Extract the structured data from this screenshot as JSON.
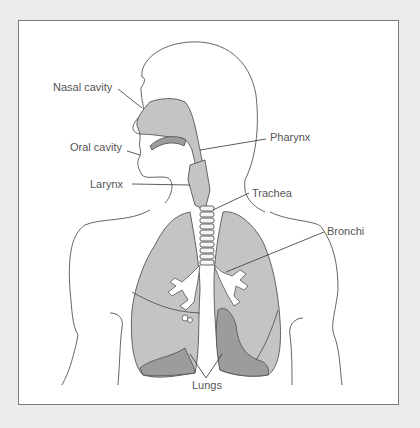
{
  "diagram": {
    "labels": {
      "nasal_cavity": "Nasal cavity",
      "oral_cavity": "Oral cavity",
      "larynx": "Larynx",
      "pharynx": "Pharynx",
      "trachea": "Trachea",
      "bronchi": "Bronchi",
      "lungs": "Lungs"
    },
    "colors": {
      "background": "#ebebeb",
      "panel": "#ffffff",
      "border": "#7a7a7a",
      "outline": "#555555",
      "tissue_light": "#c4c4c4",
      "tissue_dark": "#9c9c9c",
      "label_text": "#555555"
    }
  }
}
